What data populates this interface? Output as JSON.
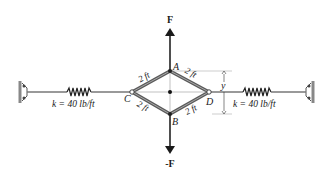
{
  "diagram": {
    "force_up_label": "F",
    "force_down_label": "-F",
    "nodes": {
      "A": "A",
      "B": "B",
      "C": "C",
      "D": "D"
    },
    "bar_lengths": {
      "CA": "2 ft",
      "AD": "2 ft",
      "CB": "2 ft",
      "BD": "2 ft"
    },
    "dimension_label": "y",
    "left_spring_label": "k = 40 lb/ft",
    "right_spring_label": "k = 40 lb/ft",
    "colors": {
      "line": "#4a4a4a",
      "bar": "#6a6a6a",
      "text": "#1a1a1a"
    }
  }
}
